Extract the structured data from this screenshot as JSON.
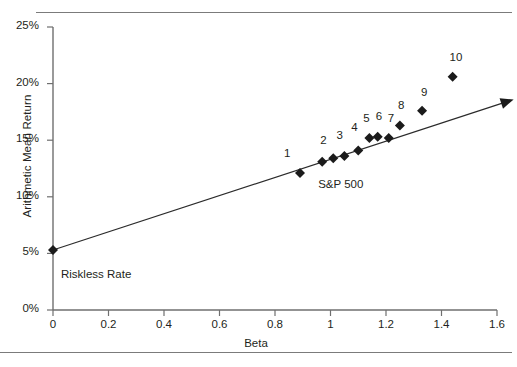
{
  "figure": {
    "top_rule": true,
    "bottom_rule": true,
    "cropped_caption": ""
  },
  "chart_data": {
    "type": "scatter",
    "title": "",
    "xlabel": "Beta",
    "ylabel": "Arithmetic Mean Return",
    "xlim": [
      0,
      1.6
    ],
    "ylim": [
      0,
      25
    ],
    "xticks": [
      "0",
      "0.2",
      "0.4",
      "0.6",
      "0.8",
      "1",
      "1.2",
      "1.4",
      "1.6"
    ],
    "xtick_values": [
      0,
      0.2,
      0.4,
      0.6,
      0.8,
      1.0,
      1.2,
      1.4,
      1.6
    ],
    "yticks": [
      "0%",
      "5%",
      "10%",
      "15%",
      "20%",
      "25%"
    ],
    "ytick_values": [
      0,
      5,
      10,
      15,
      20,
      25
    ],
    "grid": false,
    "legend": "none",
    "marker_shape": "diamond",
    "marker_color": "#1b1b1b",
    "line_color": "#2b2b2b",
    "axis_color": "#6f6f6f",
    "series": [
      {
        "name": "Portfolios",
        "points": [
          {
            "label": "1",
            "beta": 0.89,
            "return": 12.1,
            "label_dx": -12,
            "label_dy": -26
          },
          {
            "label": "2",
            "beta": 1.01,
            "return": 13.4,
            "label_dx": -9,
            "label_dy": -24
          },
          {
            "label": "3",
            "beta": 1.05,
            "return": 13.6,
            "label_dx": -4,
            "label_dy": -27
          },
          {
            "label": "4",
            "beta": 1.1,
            "return": 14.1,
            "label_dx": -3,
            "label_dy": -29
          },
          {
            "label": "5",
            "beta": 1.14,
            "return": 15.2,
            "label_dx": -2,
            "label_dy": -26
          },
          {
            "label": "6",
            "beta": 1.17,
            "return": 15.3,
            "label_dx": 2,
            "label_dy": -27
          },
          {
            "label": "7",
            "beta": 1.21,
            "return": 15.2,
            "label_dx": 3,
            "label_dy": -26
          },
          {
            "label": "8",
            "beta": 1.25,
            "return": 16.3,
            "label_dx": 2,
            "label_dy": -26
          },
          {
            "label": "9",
            "beta": 1.33,
            "return": 17.6,
            "label_dx": 3,
            "label_dy": -25
          },
          {
            "label": "10",
            "beta": 1.44,
            "return": 20.6,
            "label_dx": 1,
            "label_dy": -26
          }
        ]
      },
      {
        "name": "Benchmarks",
        "points": [
          {
            "label": "S&P 500",
            "beta": 0.97,
            "return": 13.1,
            "label_dx": -4,
            "label_dy": 16,
            "anchor": "start"
          },
          {
            "label": "Riskless Rate",
            "beta": 0.0,
            "return": 5.3,
            "label_dx": 8,
            "label_dy": 18,
            "anchor": "start"
          }
        ]
      }
    ],
    "sml_line": {
      "name": "Security Market Line",
      "from": {
        "beta": 0.0,
        "return": 5.3
      },
      "to": {
        "beta": 1.66,
        "return": 18.6
      },
      "arrow_at_end": true
    }
  }
}
